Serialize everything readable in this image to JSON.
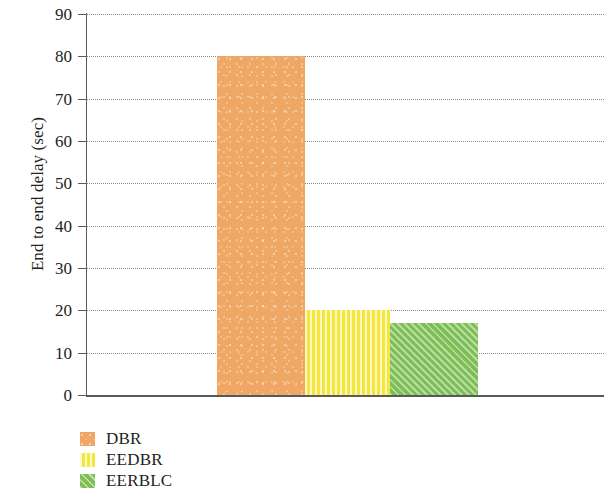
{
  "chart_data": {
    "type": "bar",
    "title": "",
    "xlabel": "",
    "ylabel": "End to end delay (sec)",
    "categories": [
      "DBR",
      "EEDBR",
      "EERBLC"
    ],
    "values": [
      80,
      20,
      17
    ],
    "ylim": [
      0,
      90
    ],
    "ytick_labels": [
      "90",
      "80",
      "70",
      "60",
      "50",
      "40",
      "30",
      "20",
      "10",
      "0"
    ],
    "ytick_values": [
      90,
      80,
      70,
      60,
      50,
      40,
      30,
      20,
      10,
      0
    ],
    "xtick_labels": [],
    "grid": "horizontal-dotted",
    "legend_position": "below-left",
    "series": [
      {
        "name": "DBR",
        "value": 80,
        "color": "#efa765",
        "pattern": "speckled",
        "swatch_icon": "legend-swatch-dbr"
      },
      {
        "name": "EEDBR",
        "value": 20,
        "color": "#f5e63c",
        "pattern": "vertical-stripes",
        "swatch_icon": "legend-swatch-eedbr"
      },
      {
        "name": "EERBLC",
        "value": 17,
        "color": "#7dbf55",
        "pattern": "diagonal-hatch",
        "swatch_icon": "legend-swatch-eerblc"
      }
    ]
  },
  "axis": {
    "color": "#58595b",
    "gridline_color": "#7a7a7a"
  }
}
